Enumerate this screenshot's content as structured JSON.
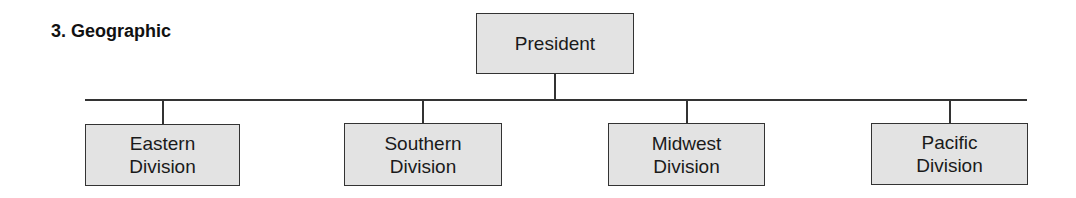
{
  "title": "3. Geographic",
  "chart": {
    "root": {
      "label": "President"
    },
    "children": [
      {
        "line1": "Eastern",
        "line2": "Division"
      },
      {
        "line1": "Southern",
        "line2": "Division"
      },
      {
        "line1": "Midwest",
        "line2": "Division"
      },
      {
        "line1": "Pacific",
        "line2": "Division"
      }
    ]
  },
  "colors": {
    "box_fill": "#e3e3e3",
    "line": "#333333"
  }
}
